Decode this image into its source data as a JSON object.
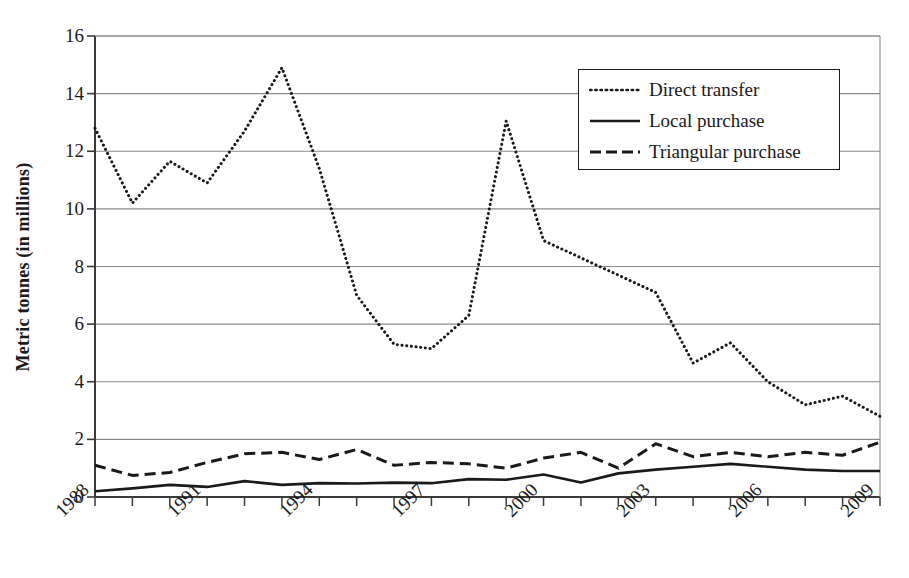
{
  "chart_data": {
    "type": "line",
    "title": "",
    "xlabel": "",
    "ylabel": "Metric tonnes (in millions)",
    "xlim": [
      1988,
      2009
    ],
    "ylim": [
      0,
      16
    ],
    "ytick_values": [
      0,
      2,
      4,
      6,
      8,
      10,
      12,
      14,
      16
    ],
    "ytick_labels": [
      "0",
      "2",
      "4",
      "6",
      "8",
      "10",
      "12",
      "14",
      "16"
    ],
    "xtick_values": [
      1988,
      1991,
      1994,
      1997,
      2000,
      2003,
      2006,
      2009
    ],
    "xtick_labels": [
      "1988",
      "1991",
      "1994",
      "1997",
      "2000",
      "2003",
      "2006",
      "2009"
    ],
    "x_minor_ticks_every": 1,
    "grid": "horizontal",
    "legend_position": "top-right",
    "x": [
      1988,
      1989,
      1990,
      1991,
      1992,
      1993,
      1994,
      1995,
      1996,
      1997,
      1998,
      1999,
      2000,
      2001,
      2002,
      2003,
      2004,
      2005,
      2006,
      2007,
      2008,
      2009
    ],
    "series": [
      {
        "name": "Direct transfer",
        "style": "dotted",
        "color": "#1a1a1a",
        "values": [
          12.8,
          10.2,
          11.65,
          10.9,
          12.7,
          14.9,
          11.4,
          7.0,
          5.3,
          5.15,
          6.3,
          13.05,
          8.9,
          8.3,
          7.7,
          7.1,
          4.65,
          5.35,
          4.0,
          3.2,
          3.5,
          2.8
        ]
      },
      {
        "name": "Local purchase",
        "style": "solid",
        "color": "#1a1a1a",
        "values": [
          0.2,
          0.3,
          0.42,
          0.35,
          0.55,
          0.42,
          0.48,
          0.47,
          0.5,
          0.48,
          0.62,
          0.6,
          0.78,
          0.5,
          0.82,
          0.95,
          1.05,
          1.15,
          1.05,
          0.95,
          0.9,
          0.9
        ]
      },
      {
        "name": "Triangular purchase",
        "style": "dashed",
        "color": "#1a1a1a",
        "values": [
          1.1,
          0.75,
          0.85,
          1.2,
          1.5,
          1.55,
          1.3,
          1.65,
          1.1,
          1.2,
          1.15,
          1.0,
          1.35,
          1.55,
          1.0,
          1.85,
          1.4,
          1.55,
          1.4,
          1.55,
          1.45,
          1.9
        ]
      }
    ]
  },
  "legend": {
    "items": [
      {
        "label": "Direct transfer",
        "style": "dotted"
      },
      {
        "label": "Local purchase",
        "style": "solid"
      },
      {
        "label": "Triangular purchase",
        "style": "dashed"
      }
    ]
  },
  "axes": {
    "ylabel": "Metric tonnes (in millions)"
  }
}
